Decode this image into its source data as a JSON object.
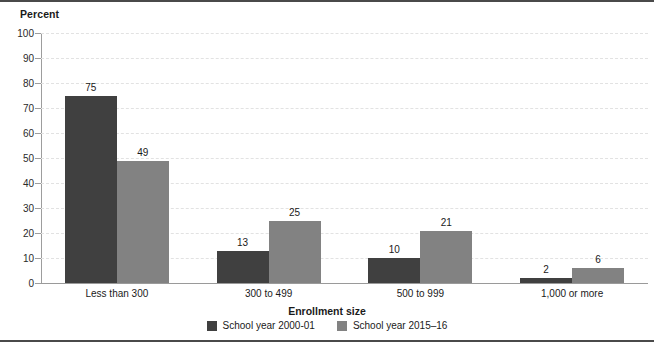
{
  "chart_data": {
    "type": "bar",
    "title": "",
    "ylabel": "Percent",
    "xlabel": "Enrollment size",
    "categories": [
      "Less than 300",
      "300 to 499",
      "500 to 999",
      "1,000 or more"
    ],
    "series": [
      {
        "name": "School year 2000-01",
        "color": "#404040",
        "values": [
          75,
          13,
          10,
          2
        ]
      },
      {
        "name": "School year 2015–16",
        "color": "#828282",
        "values": [
          49,
          25,
          21,
          6
        ]
      }
    ],
    "ylim": [
      0,
      100
    ],
    "ytick_step": 10,
    "yticks": [
      "0",
      "10",
      "20",
      "30",
      "40",
      "50",
      "60",
      "70",
      "80",
      "90",
      "100"
    ],
    "grid": true,
    "grid_style": "dashed-horizontal",
    "legend_position": "bottom-center"
  },
  "legend": {
    "items": [
      {
        "label": "School year 2000-01"
      },
      {
        "label": "School year 2015–16"
      }
    ]
  },
  "colors": {
    "series_2000_01": "#404040",
    "series_2015_16": "#828282",
    "gridline": "#e2e2e2",
    "axis": "#9a9a9a",
    "frame_rule": "#4a4a4a",
    "background": "#ffffff"
  }
}
